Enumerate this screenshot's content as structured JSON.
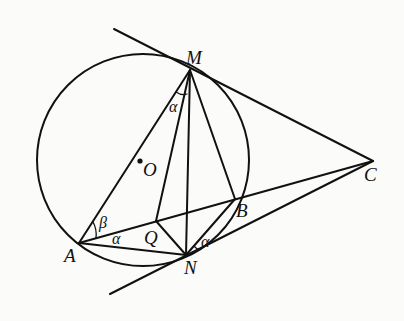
{
  "diagram": {
    "type": "geometry",
    "colors": {
      "stroke": "#111111",
      "background": "#fbfbf9"
    },
    "circle": {
      "center_label": "O",
      "cx": 143,
      "cy": 160,
      "r": 106
    },
    "points": {
      "M": {
        "label": "M",
        "x": 190,
        "y": 70
      },
      "A": {
        "label": "A",
        "x": 79,
        "y": 243
      },
      "N": {
        "label": "N",
        "x": 186,
        "y": 255
      },
      "B": {
        "label": "B",
        "x": 235,
        "y": 199
      },
      "C": {
        "label": "C",
        "x": 373,
        "y": 161
      },
      "Q": {
        "label": "Q",
        "x": 156,
        "y": 221
      },
      "O": {
        "label": "O",
        "x": 140,
        "y": 160
      }
    },
    "segments": [
      "MA",
      "MQ",
      "MN",
      "MB",
      "MC",
      "AB",
      "AN",
      "AQ",
      "QN",
      "NB",
      "NC",
      "BC"
    ],
    "tangent_lines": [
      {
        "through": "M",
        "to": "C",
        "extends_from": [
          114,
          29
        ]
      },
      {
        "through": "N",
        "to": "C",
        "extends_from": [
          110,
          294
        ]
      }
    ],
    "angle_labels": [
      {
        "symbol": "α",
        "at": "M",
        "between": [
          "MA",
          "MQ"
        ]
      },
      {
        "symbol": "β",
        "at": "A",
        "between": [
          "AM",
          "AB"
        ]
      },
      {
        "symbol": "α",
        "at": "A",
        "between": [
          "AB",
          "AN"
        ]
      },
      {
        "symbol": "α",
        "at": "N",
        "between": [
          "NB",
          "NC"
        ]
      }
    ]
  }
}
